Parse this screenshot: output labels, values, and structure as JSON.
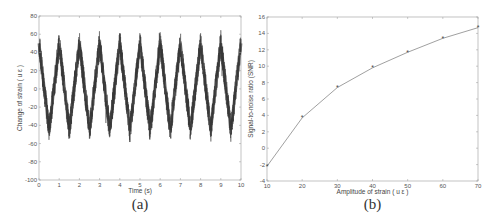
{
  "figures": {
    "a": {
      "caption": "(a)"
    },
    "b": {
      "caption": "(b)"
    }
  },
  "chart_data": [
    {
      "type": "line",
      "panel": "(a)",
      "title": "",
      "xlabel": "Time (s)",
      "ylabel": "Change of strain ( u ε )",
      "xlim": [
        0,
        10
      ],
      "ylim": [
        -100,
        80
      ],
      "xticks": [
        0,
        1,
        2,
        3,
        4,
        5,
        6,
        7,
        8,
        9,
        10
      ],
      "yticks": [
        -100,
        -80,
        -60,
        -40,
        -20,
        0,
        20,
        40,
        60,
        80
      ],
      "grid": false,
      "description": "Noisy ~1 Hz triangle wave; peaks near +50 at integer seconds, troughs near -45 at half seconds; noise band roughly ±15",
      "series": [
        {
          "name": "strain",
          "frequency_hz": 1,
          "peak": 50,
          "trough": -45,
          "noise_amplitude": 15,
          "envelope_peaks_x": [
            0,
            1,
            2,
            3,
            4,
            5,
            6,
            7,
            8,
            9,
            10
          ],
          "envelope_peaks_y": [
            68,
            68,
            66,
            72,
            70,
            70,
            72,
            68,
            70,
            64,
            70
          ],
          "envelope_troughs_x": [
            0.5,
            1.5,
            2.5,
            3.5,
            4.5,
            5.5,
            6.5,
            7.5,
            8.5,
            9.5
          ],
          "envelope_troughs_y": [
            -70,
            -67,
            -78,
            -82,
            -75,
            -66,
            -67,
            -70,
            -65,
            -82
          ]
        }
      ]
    },
    {
      "type": "line",
      "panel": "(b)",
      "title": "",
      "xlabel": "Amplitude of strain ( u ε )",
      "ylabel": "Signal-to-noise ratio (SNR)",
      "xlim": [
        10,
        70
      ],
      "ylim": [
        -4,
        16
      ],
      "xticks": [
        10,
        20,
        30,
        40,
        50,
        60,
        70
      ],
      "yticks": [
        -4,
        -2,
        0,
        2,
        4,
        6,
        8,
        10,
        12,
        14,
        16
      ],
      "grid": false,
      "x": [
        10,
        20,
        30,
        40,
        50,
        60,
        70
      ],
      "series": [
        {
          "name": "SNR",
          "values": [
            -2.2,
            3.7,
            7.4,
            9.8,
            11.7,
            13.4,
            14.7
          ],
          "marker": "*"
        }
      ]
    }
  ]
}
